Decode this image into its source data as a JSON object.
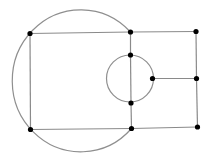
{
  "diagram": {
    "type": "graph",
    "colors": {
      "edge": "#8a8a8a",
      "arc": "#8f8f8f",
      "node": "#000000",
      "background": "#ffffff"
    },
    "nodes": [
      {
        "id": "A",
        "x": 30,
        "y": 33.5
      },
      {
        "id": "B",
        "x": 130.5,
        "y": 32
      },
      {
        "id": "C",
        "x": 196,
        "y": 31.5
      },
      {
        "id": "D",
        "x": 130.5,
        "y": 55
      },
      {
        "id": "E",
        "x": 152.5,
        "y": 78.5
      },
      {
        "id": "F",
        "x": 196.5,
        "y": 78.5
      },
      {
        "id": "G",
        "x": 131,
        "y": 103
      },
      {
        "id": "H",
        "x": 30.5,
        "y": 129.5
      },
      {
        "id": "I",
        "x": 131.5,
        "y": 128.5
      },
      {
        "id": "J",
        "x": 197.5,
        "y": 127
      }
    ],
    "edges": [
      [
        "A",
        "B"
      ],
      [
        "B",
        "C"
      ],
      [
        "A",
        "H"
      ],
      [
        "H",
        "I"
      ],
      [
        "I",
        "J"
      ],
      [
        "B",
        "D"
      ],
      [
        "D",
        "G"
      ],
      [
        "G",
        "I"
      ],
      [
        "C",
        "F"
      ],
      [
        "F",
        "J"
      ],
      [
        "E",
        "F"
      ]
    ],
    "arcs": [
      {
        "name": "large-left-arc",
        "from": "B",
        "to": "I",
        "rx": 68.5,
        "ry": 71,
        "side": "left"
      },
      {
        "name": "small-circle",
        "cx": 130,
        "cy": 78.5,
        "r": 23.5
      }
    ]
  }
}
